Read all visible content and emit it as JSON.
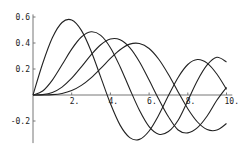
{
  "chart_data": {
    "type": "line",
    "title": "",
    "xlabel": "",
    "ylabel": "",
    "xlim": [
      0,
      10.3
    ],
    "ylim": [
      -0.37,
      0.62
    ],
    "grid": false,
    "legend": "none",
    "x_ticks": [
      {
        "value": 2,
        "label": "2."
      },
      {
        "value": 4,
        "label": "4."
      },
      {
        "value": 6,
        "label": "6."
      },
      {
        "value": 8,
        "label": "8."
      },
      {
        "value": 10,
        "label": "10."
      }
    ],
    "y_ticks": [
      {
        "value": 0.6,
        "label": "0.6"
      },
      {
        "value": 0.4,
        "label": "0.4"
      },
      {
        "value": 0.2,
        "label": "0.2"
      },
      {
        "value": -0.2,
        "label": "-0.2"
      }
    ],
    "x": [
      0,
      0.5,
      1,
      1.5,
      2,
      2.5,
      3,
      3.5,
      4,
      4.5,
      5,
      5.5,
      6,
      6.5,
      7,
      7.5,
      8,
      8.5,
      9,
      9.5,
      10
    ],
    "series": [
      {
        "name": "J1",
        "values": [
          0,
          0.2423,
          0.4401,
          0.5579,
          0.5767,
          0.4971,
          0.3391,
          0.1374,
          -0.066,
          -0.2318,
          -0.3276,
          -0.3414,
          -0.2767,
          -0.1538,
          -0.0047,
          0.1352,
          0.2346,
          0.2731,
          0.2453,
          0.1613,
          0.0435
        ]
      },
      {
        "name": "J2",
        "values": [
          0,
          0.0306,
          0.1149,
          0.2321,
          0.3528,
          0.4461,
          0.4861,
          0.4586,
          0.3641,
          0.2178,
          0.0466,
          -0.1173,
          -0.2429,
          -0.3014,
          -0.2811,
          -0.194,
          -0.0435,
          0.1117,
          0.2311,
          0.2899,
          0.2546
        ]
      },
      {
        "name": "J3",
        "values": [
          0,
          0.0026,
          0.0196,
          0.061,
          0.1289,
          0.2166,
          0.3091,
          0.3868,
          0.4302,
          0.4247,
          0.3648,
          0.2561,
          0.1148,
          -0.0329,
          -0.1676,
          -0.2691,
          -0.2911,
          -0.2509,
          -0.1613,
          -0.0407,
          0.0584
        ]
      },
      {
        "name": "J4",
        "values": [
          0,
          0.0002,
          0.0025,
          0.0118,
          0.034,
          0.0738,
          0.132,
          0.2044,
          0.2811,
          0.3484,
          0.3912,
          0.396,
          0.3576,
          0.2748,
          0.1578,
          0.0238,
          -0.1054,
          -0.2077,
          -0.2655,
          -0.2698,
          -0.2196
        ]
      }
    ],
    "colors": {
      "curve": "#222222",
      "axis": "#555555",
      "text": "#222222"
    }
  }
}
